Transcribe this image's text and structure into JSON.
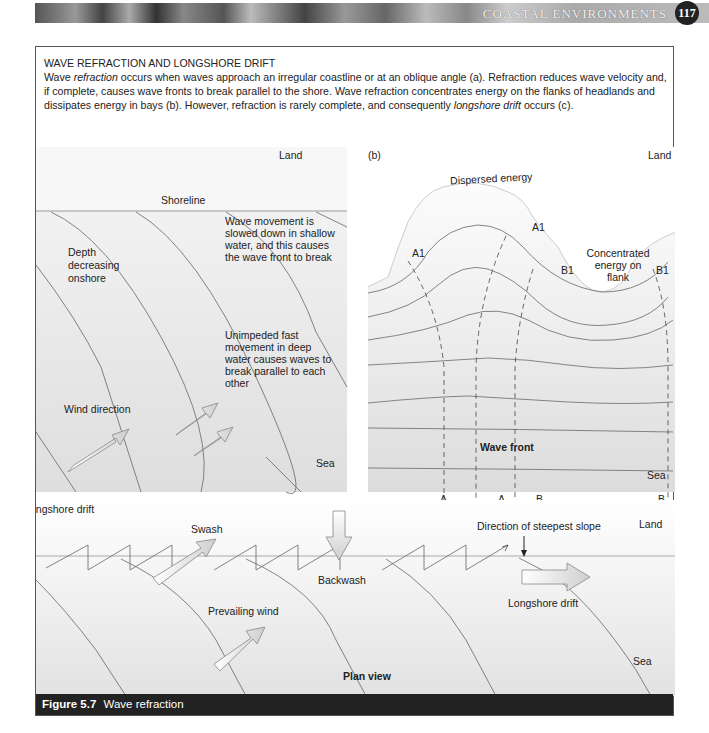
{
  "header": {
    "running_title": "COASTAL ENVIRONMENTS",
    "page_number": "117"
  },
  "intro": {
    "heading": "WAVE REFRACTION AND LONGSHORE DRIFT",
    "p1": "Wave ",
    "em1": "refraction",
    "p2": " occurs when waves approach an irregular coastline or at an oblique angle (a). Refraction reduces wave velocity and, if complete, causes wave fronts to break parallel to the shore. Wave refraction concentrates energy on the flanks of headlands and dissipates energy in bays (b). However, refraction is rarely complete, and consequently ",
    "em2": "longshore drift",
    "p3": " occurs (c)."
  },
  "panel_a": {
    "label": "(a)",
    "land": "Land",
    "shoreline": "Shoreline",
    "depth": [
      "Depth",
      "decreasing",
      "onshore"
    ],
    "slowed": [
      "Wave movement is",
      "slowed down in shallow",
      "water, and this causes",
      "the wave front to break"
    ],
    "unimpeded": [
      "Unimpeded fast",
      "movement in deep",
      "water causes waves to",
      "break parallel to each",
      "other"
    ],
    "wind": "Wind direction",
    "sea": "Sea"
  },
  "panel_b": {
    "label": "(b)",
    "land": "Land",
    "dispersed": "Dispersed energy",
    "concentrated": [
      "Concentrated",
      "energy on",
      "flank"
    ],
    "a1": "A1",
    "b1": "B1",
    "wave_front": "Wave front",
    "sea": "Sea",
    "a": "A",
    "b": "B"
  },
  "panel_c": {
    "label": "(c)  Longshore drift",
    "swash": "Swash",
    "backwash": "Backwash",
    "steepest": "Direction of steepest slope",
    "land": "Land",
    "drift": "Longshore drift",
    "prevailing": "Prevailing wind",
    "plan": "Plan view",
    "sea": "Sea"
  },
  "caption": {
    "figure": "Figure 5.7",
    "title": "Wave refraction"
  }
}
